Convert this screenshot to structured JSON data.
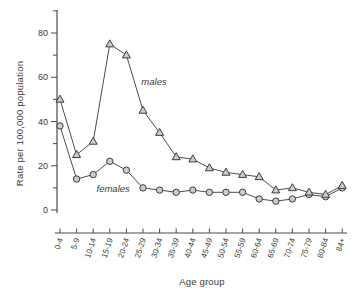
{
  "chart_data": {
    "type": "line",
    "title": "",
    "xlabel": "Age group",
    "ylabel": "Rate per 100,000 population",
    "categories": [
      "0-4",
      "5-9",
      "10-14",
      "15-19",
      "20-24",
      "25-29",
      "30-34",
      "35-39",
      "40-44",
      "45-49",
      "50-54",
      "55-59",
      "60-64",
      "65-69",
      "70-74",
      "75-79",
      "80-84",
      "84+"
    ],
    "series": [
      {
        "name": "males",
        "marker": "triangle",
        "values": [
          50,
          25,
          31,
          75,
          70,
          45,
          35,
          24,
          23,
          19,
          17,
          16,
          15,
          9,
          10,
          8,
          7,
          11
        ]
      },
      {
        "name": "females",
        "marker": "circle",
        "values": [
          38,
          14,
          16,
          22,
          18,
          10,
          9,
          8,
          9,
          8,
          8,
          8,
          5,
          4,
          5,
          7,
          6,
          10
        ]
      }
    ],
    "ylim": [
      0,
      90
    ],
    "yticks": [
      0,
      20,
      40,
      60,
      80
    ],
    "minor_tick_step": 10,
    "grid": false,
    "legend_position": "inline-annotations",
    "annotations": [
      {
        "text": "males",
        "x_index": 4.9,
        "value": 58
      },
      {
        "text": "females",
        "x_index": 2.2,
        "value": 9.5
      }
    ],
    "colors": {
      "line": "#4d4d4d",
      "marker_fill": "#cccccc",
      "marker_stroke": "#3d3d3d",
      "axis": "#4a4a4a",
      "text": "#3a3a3a"
    }
  }
}
